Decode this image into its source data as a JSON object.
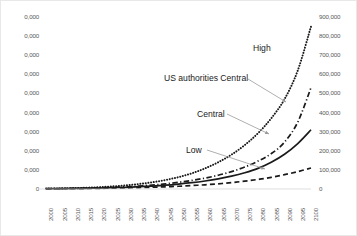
{
  "chart_data": {
    "type": "line",
    "title": "",
    "xlabel": "",
    "ylabel": "",
    "grid": false,
    "legend_position": "inline-annotations",
    "x": [
      2000,
      2005,
      2010,
      2015,
      2020,
      2025,
      2030,
      2035,
      2040,
      2045,
      2050,
      2055,
      2060,
      2065,
      2070,
      2075,
      2080,
      2085,
      2090,
      2095,
      2100
    ],
    "xlim": [
      2000,
      2100
    ],
    "x_ticklabels": [
      "2000",
      "2005",
      "2010",
      "2015",
      "2020",
      "2025",
      "2030",
      "2035",
      "2040",
      "2045",
      "2050",
      "2055",
      "2060",
      "2065",
      "2070",
      "2075",
      "2080",
      "2085",
      "2090",
      "2095",
      "2100"
    ],
    "axis_left": {
      "ylim": [
        0,
        90000
      ],
      "ticks": [
        0,
        10000,
        20000,
        30000,
        40000,
        50000,
        60000,
        70000,
        80000,
        90000
      ],
      "ticklabels": [
        "0",
        "10,000",
        "20,000",
        "30,000",
        "40,000",
        "50,000",
        "60,000",
        "70,000",
        "80,000",
        "90,000"
      ],
      "ticklabels_rendered": [
        "0",
        "0,000",
        "0,000",
        "0,000",
        "0,000",
        "0,000",
        "0,000",
        "0,000",
        "0,000",
        "0,000"
      ],
      "note_clipped": "Left tick labels are clipped at the left edge of the screenshot; only the trailing characters are visible."
    },
    "axis_right": {
      "ylim": [
        0,
        900000
      ],
      "ticks": [
        0,
        100000,
        200000,
        300000,
        400000,
        500000,
        600000,
        700000,
        800000,
        900000
      ],
      "ticklabels": [
        "0",
        "100,000",
        "200,000",
        "300,000",
        "400,000",
        "500,000",
        "600,000",
        "700,000",
        "800,000",
        "900,000"
      ]
    },
    "series": [
      {
        "name": "High",
        "style": "dotted",
        "color": "#1a1a1a",
        "axis": "right",
        "values": [
          2000,
          3000,
          4500,
          6500,
          9500,
          13500,
          19000,
          26000,
          35000,
          47000,
          62000,
          82000,
          108000,
          140000,
          180000,
          230000,
          292000,
          370000,
          470000,
          620000,
          850000
        ]
      },
      {
        "name": "US authorities Central",
        "style": "dash-dot",
        "color": "#1a1a1a",
        "axis": "right",
        "values": [
          1500,
          2200,
          3200,
          4500,
          6200,
          8500,
          11500,
          15500,
          20500,
          27000,
          35000,
          45000,
          57000,
          72000,
          91000,
          115000,
          146000,
          185000,
          245000,
          350000,
          530000
        ]
      },
      {
        "name": "Central",
        "style": "solid",
        "color": "#1a1a1a",
        "axis": "right",
        "values": [
          1200,
          1800,
          2600,
          3600,
          5000,
          6800,
          9000,
          12000,
          15500,
          20000,
          26000,
          33000,
          42000,
          53000,
          67000,
          85000,
          108000,
          140000,
          182000,
          238000,
          310000
        ]
      },
      {
        "name": "Low",
        "style": "dashed",
        "color": "#1a1a1a",
        "axis": "right",
        "values": [
          900,
          1300,
          1800,
          2500,
          3400,
          4500,
          5800,
          7400,
          9300,
          11600,
          14500,
          18000,
          22000,
          27000,
          33500,
          41000,
          50000,
          61000,
          75000,
          91000,
          110000
        ]
      }
    ],
    "annotations": [
      {
        "text": "High",
        "x_px": 252,
        "y_px": 43
      },
      {
        "text": "US authorities Central",
        "x_px": 163,
        "y_px": 73
      },
      {
        "text": "Central",
        "x_px": 196,
        "y_px": 109
      },
      {
        "text": "Low",
        "x_px": 185,
        "y_px": 145
      }
    ]
  }
}
